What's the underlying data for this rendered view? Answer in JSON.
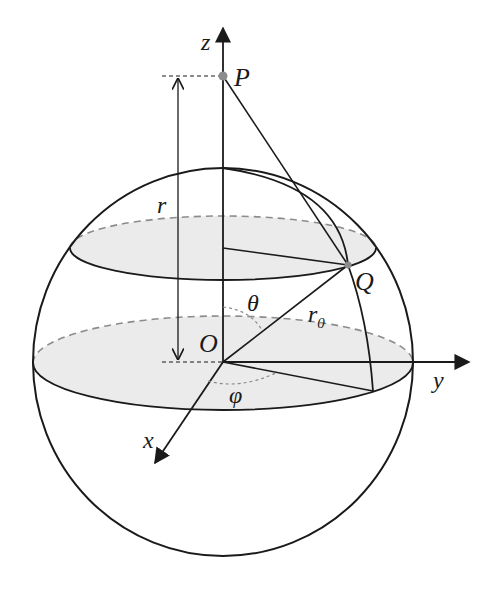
{
  "diagram": {
    "type": "spherical-coordinates-sphere",
    "colors": {
      "stroke": "#1a1a1a",
      "dashed": "#8c8c8c",
      "shade": "#ebebeb",
      "point": "#8c8c8c",
      "background": "#ffffff"
    },
    "labels": {
      "z_axis": "z",
      "y_axis": "y",
      "x_axis": "x",
      "point_p": "P",
      "point_q": "Q",
      "origin": "O",
      "distance_r": "r",
      "radius": "r",
      "radius_subscript": "0",
      "polar_angle": "θ",
      "azimuth_angle": "φ"
    }
  }
}
